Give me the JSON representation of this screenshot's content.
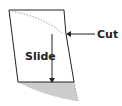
{
  "diagram": {
    "labels": {
      "slide": "Slide",
      "cut": "Cut"
    },
    "colors": {
      "stroke": "#222222",
      "dashed": "#999999",
      "shade": "#cccccc"
    }
  }
}
